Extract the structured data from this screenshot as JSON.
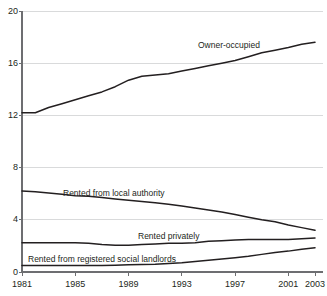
{
  "chart_data": {
    "type": "line",
    "title": "",
    "subtitle": "",
    "xlabel": "",
    "ylabel": "",
    "xlim": [
      1981,
      2003
    ],
    "ylim": [
      0,
      20
    ],
    "y_ticks": [
      0,
      4,
      8,
      12,
      16,
      20
    ],
    "x_ticks": [
      1981,
      1985,
      1989,
      1993,
      1997,
      2001,
      2003
    ],
    "x_tick_labels": [
      "1981",
      "1985",
      "1989",
      "1993",
      "1997",
      "2001",
      "2003"
    ],
    "y_tick_labels": [
      "0",
      "4",
      "8",
      "12",
      "16",
      "20"
    ],
    "grid": "horizontal",
    "legend": "inline-annotations",
    "units": "millions of dwellings",
    "x": [
      1981,
      1982,
      1983,
      1984,
      1985,
      1986,
      1987,
      1988,
      1989,
      1990,
      1991,
      1992,
      1993,
      1994,
      1995,
      1996,
      1997,
      1998,
      1999,
      2000,
      2001,
      2002,
      2003
    ],
    "series": [
      {
        "name": "Owner-occupied",
        "color": "#231f20",
        "values": [
          12.2,
          12.2,
          12.6,
          12.9,
          13.2,
          13.5,
          13.8,
          14.2,
          14.7,
          15.0,
          15.1,
          15.2,
          15.4,
          15.6,
          15.8,
          16.0,
          16.2,
          16.5,
          16.8,
          17.0,
          17.2,
          17.45,
          17.6
        ]
      },
      {
        "name": "Rented from local authority",
        "color": "#231f20",
        "values": [
          6.2,
          6.15,
          6.05,
          5.95,
          5.85,
          5.8,
          5.7,
          5.6,
          5.5,
          5.4,
          5.3,
          5.2,
          5.05,
          4.9,
          4.75,
          4.6,
          4.4,
          4.2,
          4.0,
          3.85,
          3.6,
          3.4,
          3.2
        ]
      },
      {
        "name": "Rented privately",
        "color": "#231f20",
        "values": [
          2.25,
          2.25,
          2.25,
          2.25,
          2.25,
          2.2,
          2.1,
          2.05,
          2.05,
          2.1,
          2.15,
          2.2,
          2.2,
          2.25,
          2.35,
          2.4,
          2.45,
          2.5,
          2.5,
          2.5,
          2.5,
          2.55,
          2.6
        ]
      },
      {
        "name": "Rented from registered social landlords",
        "color": "#231f20",
        "values": [
          0.5,
          0.5,
          0.5,
          0.5,
          0.5,
          0.5,
          0.5,
          0.52,
          0.55,
          0.58,
          0.6,
          0.65,
          0.7,
          0.8,
          0.9,
          1.0,
          1.1,
          1.2,
          1.35,
          1.5,
          1.6,
          1.75,
          1.85
        ]
      }
    ],
    "annotations": [
      {
        "text": "Owner-occupied",
        "x_px": 198,
        "y_px": 41
      },
      {
        "text": "Rented from local authority",
        "x_px": 63,
        "y_px": 189
      },
      {
        "text": "Rented privately",
        "x_px": 138,
        "y_px": 232
      },
      {
        "text": "Rented from registered social landlords",
        "x_px": 28,
        "y_px": 255
      }
    ],
    "axis_color": "#6d6e71",
    "grid_color": "#d9dadb",
    "line_color": "#231f20",
    "text_color": "#231f20"
  }
}
